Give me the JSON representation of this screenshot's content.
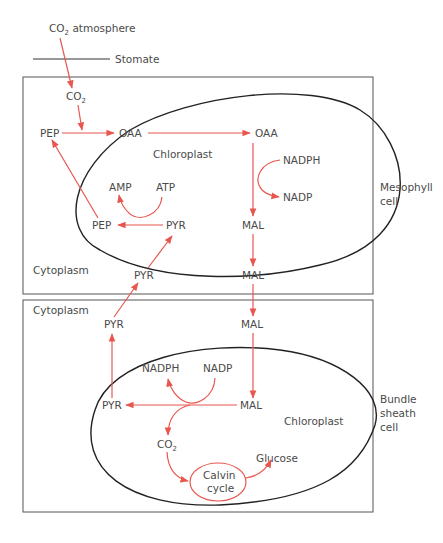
{
  "colors": {
    "arrow": "#e8574f",
    "text": "#4a4a4a",
    "membrane": "#222222",
    "cell_border": "#555555"
  },
  "labels": {
    "co2_atmosphere_main": "CO",
    "co2_atmosphere_sub": "2",
    "co2_atmosphere_rest": " atmosphere",
    "stomate": "Stomate",
    "co2_main": "CO",
    "co2_sub": "2",
    "mesophyll": {
      "pep_cyto": "PEP",
      "oaa_cyto": "OAA",
      "oaa_chloro": "OAA",
      "chloroplast": "Chloroplast",
      "nadph": "NADPH",
      "nadp": "NADP",
      "amp": "AMP",
      "atp": "ATP",
      "pep_chloro": "PEP",
      "pyr_chloro": "PYR",
      "mal_chloro": "MAL",
      "cytoplasm": "Cytoplasm",
      "pyr_cyto": "PYR",
      "mal_cyto": "MAL",
      "cell_label_line1": "Mesophyll",
      "cell_label_line2": "cell"
    },
    "bundle_sheath": {
      "cytoplasm": "Cytoplasm",
      "pyr_cyto": "PYR",
      "mal_cyto": "MAL",
      "nadph": "NADPH",
      "nadp": "NADP",
      "pyr_chloro": "PYR",
      "mal_chloro": "MAL",
      "chloroplast": "Chloroplast",
      "co2_main": "CO",
      "co2_sub": "2",
      "calvin_line1": "Calvin",
      "calvin_line2": "cycle",
      "glucose": "Glucose",
      "cell_label_line1": "Bundle",
      "cell_label_line2": "sheath",
      "cell_label_line3": "cell"
    }
  }
}
